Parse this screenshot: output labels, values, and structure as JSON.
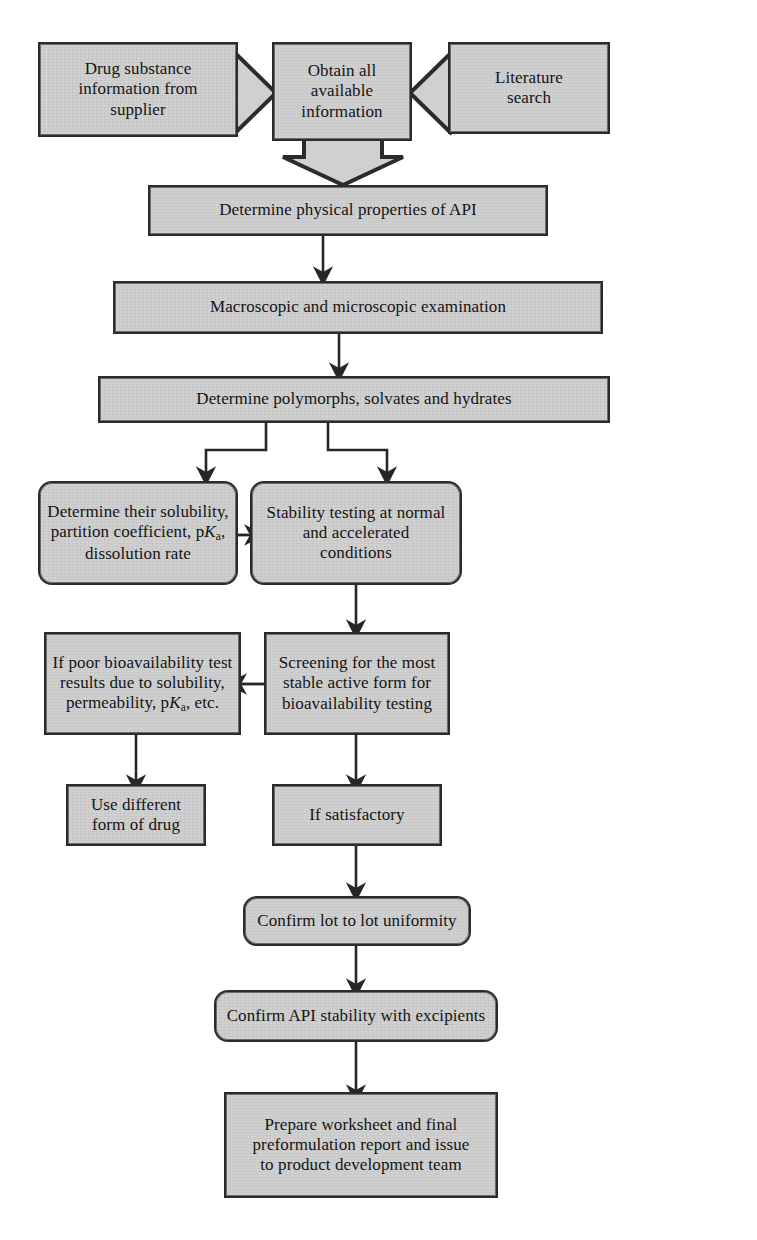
{
  "diagram": {
    "colors": {
      "box_fill": "#d0d0d0",
      "box_border": "#2b2b2b",
      "arrow": "#262626",
      "background": "#ffffff"
    },
    "nodes": {
      "drug_substance": {
        "label": "Drug substance information from supplier",
        "lines": [
          "Drug substance",
          "information from",
          "supplier"
        ],
        "shape": "rectangle-arrow-right"
      },
      "obtain_all": {
        "label": "Obtain all available information",
        "lines": [
          "Obtain all",
          "available",
          "information"
        ],
        "shape": "rectangle"
      },
      "literature_search": {
        "label": "Literature search",
        "lines": [
          "Literature",
          "search"
        ],
        "shape": "rectangle-arrow-left"
      },
      "physical_properties": {
        "label": "Determine physical properties of API",
        "shape": "rectangle"
      },
      "macro_micro": {
        "label": "Macroscopic and microscopic examination",
        "shape": "rectangle"
      },
      "polymorphs": {
        "label": "Determine polymorphs, solvates and hydrates",
        "shape": "rectangle"
      },
      "solubility": {
        "label": "Determine their solubility, partition coefficient, pKa, dissolution rate",
        "lines": [
          "Determine their solubility,",
          "partition coefficient, pKa,",
          "dissolution rate"
        ],
        "shape": "rounded-rectangle"
      },
      "stability_testing": {
        "label": "Stability testing at normal and accelerated conditions",
        "lines": [
          "Stability testing at normal",
          "and accelerated",
          "conditions"
        ],
        "shape": "rounded-rectangle"
      },
      "poor_bioavailability": {
        "label": "If poor bioavailability test results due to solubility, permeability, pKa, etc.",
        "lines": [
          "If poor bioavailability test",
          "results due to solubility,",
          "permeability, pKa, etc."
        ],
        "shape": "rectangle"
      },
      "screening": {
        "label": "Screening for the most stable active form for bioavailability testing",
        "lines": [
          "Screening for the most",
          "stable active form for",
          "bioavailability testing"
        ],
        "shape": "rectangle"
      },
      "use_different_form": {
        "label": "Use different form of drug",
        "lines": [
          "Use different",
          "form of drug"
        ],
        "shape": "rectangle"
      },
      "if_satisfactory": {
        "label": "If satisfactory",
        "shape": "rectangle"
      },
      "lot_uniformity": {
        "label": "Confirm lot to lot uniformity",
        "shape": "rounded-rectangle"
      },
      "api_stability": {
        "label": "Confirm API stability with excipients",
        "shape": "rounded-rectangle"
      },
      "prepare_worksheet": {
        "label": "Prepare worksheet and final preformulation report and issue to product development team",
        "lines": [
          "Prepare worksheet and final",
          "preformulation report and issue",
          "to product development team"
        ],
        "shape": "rectangle"
      }
    },
    "edges": [
      {
        "from": "drug_substance",
        "to": "obtain_all",
        "style": "block-chevron-right"
      },
      {
        "from": "literature_search",
        "to": "obtain_all",
        "style": "block-chevron-left"
      },
      {
        "from": "obtain_all",
        "to": "physical_properties",
        "style": "block-arrow-down"
      },
      {
        "from": "physical_properties",
        "to": "macro_micro",
        "style": "line-arrow-down"
      },
      {
        "from": "macro_micro",
        "to": "polymorphs",
        "style": "line-arrow-down"
      },
      {
        "from": "polymorphs",
        "to": "solubility",
        "style": "elbow-arrow-down-left"
      },
      {
        "from": "polymorphs",
        "to": "stability_testing",
        "style": "elbow-arrow-down-right"
      },
      {
        "from": "solubility",
        "to": "stability_testing",
        "style": "line-arrow-right"
      },
      {
        "from": "stability_testing",
        "to": "screening",
        "style": "line-arrow-down"
      },
      {
        "from": "screening",
        "to": "poor_bioavailability",
        "style": "line-arrow-left"
      },
      {
        "from": "poor_bioavailability",
        "to": "use_different_form",
        "style": "line-arrow-down"
      },
      {
        "from": "screening",
        "to": "if_satisfactory",
        "style": "line-arrow-down"
      },
      {
        "from": "if_satisfactory",
        "to": "lot_uniformity",
        "style": "line-arrow-down"
      },
      {
        "from": "lot_uniformity",
        "to": "api_stability",
        "style": "line-arrow-down"
      },
      {
        "from": "api_stability",
        "to": "prepare_worksheet",
        "style": "line-arrow-down"
      }
    ]
  }
}
